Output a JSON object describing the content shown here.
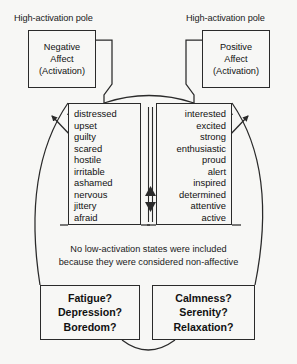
{
  "diagram": {
    "poles": {
      "left_label": "High-activation pole",
      "right_label": "High-activation pole"
    },
    "affect_boxes": {
      "negative": {
        "line1": "Negative",
        "line2": "Affect",
        "line3": "(Activation)"
      },
      "positive": {
        "line1": "Positive",
        "line2": "Affect",
        "line3": "(Activation)"
      }
    },
    "negative_items": [
      "distressed",
      "upset",
      "guilty",
      "scared",
      "hostile",
      "irritable",
      "ashamed",
      "nervous",
      "jittery",
      "afraid"
    ],
    "positive_items": [
      "interested",
      "excited",
      "strong",
      "enthusiastic",
      "proud",
      "alert",
      "inspired",
      "determined",
      "attentive",
      "active"
    ],
    "note": {
      "line1": "No low-activation states were included",
      "line2": "because they were considered non-affective"
    },
    "question_boxes": {
      "left": {
        "line1": "Fatigue?",
        "line2": "Depression?",
        "line3": "Boredom?"
      },
      "right": {
        "line1": "Calmness?",
        "line2": "Serenity?",
        "line3": "Relaxation?"
      }
    },
    "colors": {
      "background": "#f7f7f5",
      "stroke": "#2a2a2a",
      "text": "#1a1a1a"
    }
  }
}
